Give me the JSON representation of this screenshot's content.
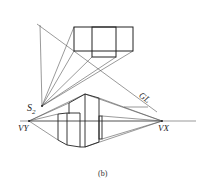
{
  "figure": {
    "caption": "(b)",
    "labels": {
      "station_point": "S",
      "station_point_sub": "2",
      "ground_line": "GL",
      "vanishing_left": "VY",
      "vanishing_right": "VX"
    },
    "colors": {
      "line": "#222222",
      "thin_line": "#444444",
      "background": "#ffffff"
    }
  }
}
